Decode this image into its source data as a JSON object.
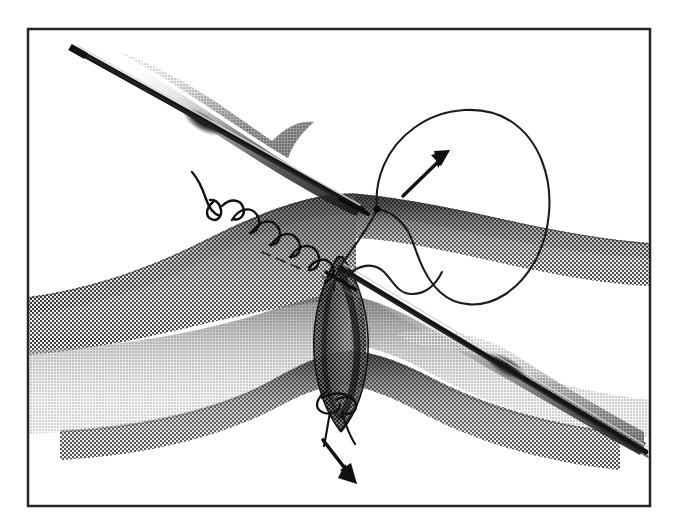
{
  "figure": {
    "domain": "Natural-Image",
    "media": "black-and-white halftone medical line illustration",
    "title": "Anastomosis suturing technique with two forceps and running suture",
    "caption": "",
    "background_color": "#ffffff",
    "ink_color": "#1a1a1a",
    "frame": {
      "name": "illustration-border",
      "x": 28,
      "y": 29,
      "width": 622,
      "height": 477,
      "stroke_color": "#242424",
      "stroke_width": 2.5,
      "fill": "#ffffff"
    },
    "labels": [],
    "annotations": [
      {
        "name": "traction-arrow-upper-right",
        "type": "arrow",
        "direction": "up-right",
        "from": [
          403,
          196
        ],
        "to": [
          448,
          152
        ],
        "color": "#111111",
        "meaning": "suture loop pulled up and to the right"
      },
      {
        "name": "traction-arrow-lower",
        "type": "arrow",
        "direction": "down-right",
        "from": [
          324,
          441
        ],
        "to": [
          355,
          482
        ],
        "color": "#111111",
        "meaning": "knot tails pulled down and to the right"
      }
    ],
    "elements": [
      {
        "name": "forceps-upper-left",
        "kind": "instrument",
        "description": "fine tipped forceps entering from upper left, tip at incision apex"
      },
      {
        "name": "forceps-lower-right",
        "kind": "instrument",
        "description": "fine tipped forceps entering from lower right, tip crossing the incision"
      },
      {
        "name": "tissue-upper-flap",
        "kind": "tissue",
        "description": "upper tubular tissue edge with halftone shading"
      },
      {
        "name": "tissue-lower-flap",
        "kind": "tissue",
        "description": "lower tubular tissue edge with halftone shading"
      },
      {
        "name": "incision-opening",
        "kind": "tissue",
        "description": "dark lens-shaped open lumen between the flaps"
      },
      {
        "name": "running-suture",
        "kind": "suture",
        "description": "continuous running stitch along the upper tissue edge, seven loops"
      },
      {
        "name": "suture-loop-large",
        "kind": "suture",
        "description": "large free loop of suture thread on the right"
      },
      {
        "name": "knot-upper-left",
        "kind": "suture",
        "description": "anchor knot with short tail at the left end of the running suture"
      },
      {
        "name": "knot-lower",
        "kind": "suture",
        "description": "knot with two trailing tails at the inferior apex of the incision"
      }
    ]
  }
}
